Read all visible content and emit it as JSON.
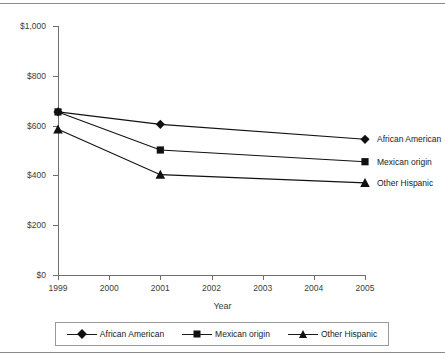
{
  "chart_data": {
    "type": "line",
    "title": "",
    "xlabel": "Year",
    "ylabel": "",
    "x": [
      1999,
      2001,
      2005
    ],
    "categories": [
      "1999",
      "2001",
      "2005"
    ],
    "series": [
      {
        "name": "African American",
        "marker": "diamond",
        "values": [
          655,
          605,
          545
        ]
      },
      {
        "name": "Mexican origin",
        "marker": "square",
        "values": [
          655,
          502,
          455
        ]
      },
      {
        "name": "Other Hispanic",
        "marker": "triangle",
        "values": [
          585,
          403,
          370
        ]
      }
    ],
    "ylim": [
      0,
      1000
    ],
    "xlim": [
      1999,
      2005
    ],
    "yticks": [
      0,
      200,
      400,
      600,
      800,
      1000
    ],
    "ytick_labels": [
      "$0",
      "$200",
      "$400",
      "$600",
      "$800",
      "$1,000"
    ],
    "xticks": [
      1999,
      2000,
      2001,
      2002,
      2003,
      2004,
      2005
    ],
    "xtick_labels": [
      "1999",
      "2000",
      "2001",
      "2002",
      "2003",
      "2004",
      "2005"
    ],
    "grid": false,
    "legend_position": "bottom",
    "line_color": "#111111",
    "axis_color": "#6f6f6f",
    "text_color": "#3c3c3c"
  },
  "axis": {
    "x_title": "Year",
    "y_labels": [
      "$1,000",
      "$800",
      "$600",
      "$400",
      "$200",
      "$0"
    ],
    "x_labels": [
      "1999",
      "2000",
      "2001",
      "2002",
      "2003",
      "2004",
      "2005"
    ]
  },
  "inline_labels": [
    {
      "text": "African American"
    },
    {
      "text": "Mexican origin"
    },
    {
      "text": "Other Hispanic"
    }
  ],
  "legend": {
    "items": [
      {
        "label": "African American",
        "marker": "diamond"
      },
      {
        "label": "Mexican origin",
        "marker": "square"
      },
      {
        "label": "Other Hispanic",
        "marker": "triangle"
      }
    ]
  }
}
